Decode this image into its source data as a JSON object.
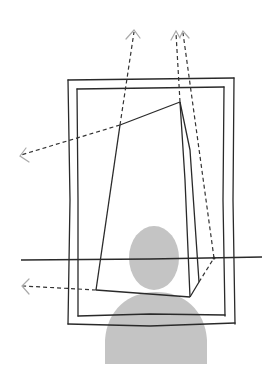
{
  "diagram": {
    "colors": {
      "line": "#2a2a2a",
      "dashed_line": "#333333",
      "arrowhead": "#aaaaaa",
      "silhouette": "#c4c4c4",
      "background": "#ffffff"
    },
    "elements": {
      "outer_frame": {
        "x1": 68,
        "y1": 79,
        "x2": 234,
        "y2": 324
      },
      "inner_frame": {
        "x1": 77,
        "y1": 88,
        "x2": 224,
        "y2": 316
      },
      "horizon_line": {
        "x1": 21,
        "y1": 260,
        "x2": 262,
        "y2": 257
      },
      "tilted_panel": {
        "points": [
          [
            120,
            125
          ],
          [
            180,
            102
          ],
          [
            199,
            282
          ],
          [
            190,
            297
          ],
          [
            96,
            290
          ]
        ]
      },
      "person": {
        "head": {
          "cx": 154,
          "cy": 258,
          "rx": 25,
          "ry": 32
        },
        "body": {
          "left": 105,
          "right": 207,
          "top": 292,
          "bottom": 364
        }
      },
      "dashed_rays": [
        {
          "from": [
            120,
            125
          ],
          "to": [
            134,
            31
          ],
          "arrow": "up"
        },
        {
          "from": [
            180,
            102
          ],
          "to": [
            176,
            32
          ],
          "arrow": "up"
        },
        {
          "from": [
            214,
            258
          ],
          "to": [
            183,
            32
          ],
          "arrow": "up"
        },
        {
          "from": [
            120,
            125
          ],
          "to": [
            20,
            156
          ],
          "arrow": "left"
        },
        {
          "from": [
            96,
            290
          ],
          "to": [
            22,
            286
          ],
          "arrow": "left"
        },
        {
          "from": [
            199,
            282
          ],
          "to": [
            214,
            258
          ],
          "arrow": "none"
        }
      ]
    }
  }
}
